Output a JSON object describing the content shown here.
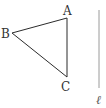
{
  "diagram": {
    "type": "geometry",
    "width": 106,
    "height": 108,
    "colors": {
      "stroke": "#2b2b2b",
      "line_l": "#9a9a9a",
      "label": "#333333",
      "background": "#ffffff"
    },
    "triangle": {
      "vertices": [
        {
          "name": "A",
          "x": 67,
          "y": 18,
          "label_x": 63,
          "label_y": 15
        },
        {
          "name": "B",
          "x": 12,
          "y": 33,
          "label_x": 1,
          "label_y": 38
        },
        {
          "name": "C",
          "x": 67,
          "y": 77,
          "label_x": 61,
          "label_y": 91
        }
      ]
    },
    "line": {
      "name": "ℓ",
      "x1": 99,
      "y1": 10,
      "x2": 99,
      "y2": 88,
      "label_x": 96,
      "label_y": 104
    }
  }
}
